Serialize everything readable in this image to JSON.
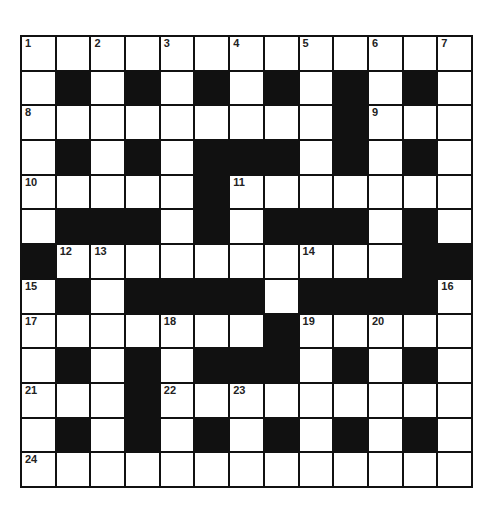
{
  "puzzle": {
    "rows": 13,
    "cols": 13,
    "colors": {
      "block": "#111111",
      "cell": "#ffffff",
      "line": "#111111"
    },
    "grid": [
      ".............",
      ".#.#.#.#.#.#.",
      ".........#...",
      ".#.#.###.#.#.",
      ".....#.......",
      ".###.#.###.#.",
      "#..........##",
      ".#.####.####.",
      ".......#.....",
      ".#.#.###.#.#.",
      "...#.........",
      ".#.#.#.#.#.#.",
      "............."
    ],
    "numbers": [
      {
        "r": 0,
        "c": 0,
        "n": "1"
      },
      {
        "r": 0,
        "c": 2,
        "n": "2"
      },
      {
        "r": 0,
        "c": 4,
        "n": "3"
      },
      {
        "r": 0,
        "c": 6,
        "n": "4"
      },
      {
        "r": 0,
        "c": 8,
        "n": "5"
      },
      {
        "r": 0,
        "c": 10,
        "n": "6"
      },
      {
        "r": 0,
        "c": 12,
        "n": "7"
      },
      {
        "r": 2,
        "c": 0,
        "n": "8"
      },
      {
        "r": 2,
        "c": 10,
        "n": "9"
      },
      {
        "r": 4,
        "c": 0,
        "n": "10"
      },
      {
        "r": 4,
        "c": 6,
        "n": "11"
      },
      {
        "r": 6,
        "c": 1,
        "n": "12"
      },
      {
        "r": 6,
        "c": 2,
        "n": "13"
      },
      {
        "r": 6,
        "c": 8,
        "n": "14"
      },
      {
        "r": 7,
        "c": 0,
        "n": "15"
      },
      {
        "r": 7,
        "c": 12,
        "n": "16"
      },
      {
        "r": 8,
        "c": 0,
        "n": "17"
      },
      {
        "r": 8,
        "c": 4,
        "n": "18"
      },
      {
        "r": 8,
        "c": 8,
        "n": "19"
      },
      {
        "r": 8,
        "c": 10,
        "n": "20"
      },
      {
        "r": 10,
        "c": 0,
        "n": "21"
      },
      {
        "r": 10,
        "c": 4,
        "n": "22"
      },
      {
        "r": 10,
        "c": 6,
        "n": "23"
      },
      {
        "r": 12,
        "c": 0,
        "n": "24"
      }
    ]
  }
}
